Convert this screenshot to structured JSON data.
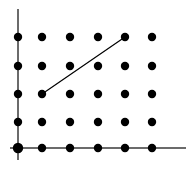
{
  "figure": {
    "title": "",
    "width": 194,
    "height": 169,
    "background_color": "#ffffff"
  },
  "chart_data": {
    "type": "scatter",
    "title": "",
    "subtitle": "",
    "xlabel": "",
    "ylabel": "",
    "grid": false,
    "legend": null,
    "xlim": [
      0,
      5
    ],
    "ylim": [
      0,
      4
    ],
    "x_tick_labels": [],
    "y_tick_labels": [],
    "categories": [
      0,
      1,
      2,
      3,
      4,
      5
    ],
    "series": [
      {
        "name": "lattice points",
        "marker": "filled-circle",
        "color": "#000000",
        "x": [
          0,
          1,
          2,
          3,
          4,
          5,
          0,
          1,
          2,
          3,
          4,
          5,
          0,
          1,
          2,
          3,
          4,
          5,
          0,
          1,
          2,
          3,
          4,
          5,
          0,
          1,
          2,
          3,
          4,
          5
        ],
        "y": [
          4,
          4,
          4,
          4,
          4,
          4,
          3,
          3,
          3,
          3,
          3,
          3,
          2,
          2,
          2,
          2,
          2,
          2,
          1,
          1,
          1,
          1,
          1,
          1,
          0,
          0,
          0,
          0,
          0,
          0
        ]
      }
    ],
    "annotations": [
      {
        "name": "line-segment",
        "type": "segment",
        "from": [
          1,
          2
        ],
        "to": [
          4,
          4
        ],
        "color": "#000000",
        "width": 1.2
      }
    ],
    "axes": {
      "x_axis": {
        "name": "x-axis",
        "color": "#6b6b6b",
        "width": 2,
        "from_px": [
          10,
          148
        ],
        "to_px": [
          186,
          148
        ]
      },
      "y_axis": {
        "name": "y-axis",
        "color": "#6b6b6b",
        "width": 2,
        "from_px": [
          18,
          9
        ],
        "to_px": [
          18,
          160
        ]
      }
    },
    "pixel_mapping": {
      "column_x_px": [
        18,
        42,
        70,
        98,
        125,
        152
      ],
      "row_y_px": [
        37,
        66,
        94,
        122,
        148
      ],
      "row_y_values": [
        4,
        3,
        2,
        1,
        0
      ],
      "dot_radius_px": 4.2,
      "origin_dot_radius_px": 5.2
    }
  }
}
